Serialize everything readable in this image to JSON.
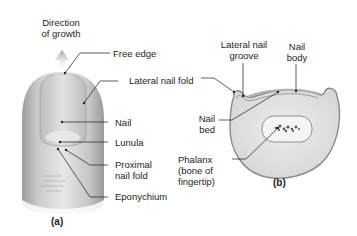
{
  "diagram": {
    "panel_a": {
      "label": "(a)",
      "growth_label_line1": "Direction",
      "growth_label_line2": "of growth",
      "labels": {
        "free_edge": "Free edge",
        "lateral_nail_fold": "Lateral nail fold",
        "nail": "Nail",
        "lunula": "Lunula",
        "proximal_nail_fold_line1": "Proximal",
        "proximal_nail_fold_line2": "nail fold",
        "eponychium": "Eponychium"
      }
    },
    "panel_b": {
      "label": "(b)",
      "labels": {
        "lateral_nail_groove_line1": "Lateral nail",
        "lateral_nail_groove_line2": "groove",
        "nail_body_line1": "Nail",
        "nail_body_line2": "body",
        "nail_bed_line1": "Nail",
        "nail_bed_line2": "bed",
        "phalanx_line1": "Phalanx",
        "phalanx_line2": "(bone of",
        "phalanx_line3": "fingertip)"
      }
    },
    "colors": {
      "skin_light": "#e6e6e6",
      "skin_mid": "#c8c8c8",
      "skin_dark": "#a9a9a9",
      "leader": "#333333",
      "arrow": "#b8b8b8"
    }
  }
}
